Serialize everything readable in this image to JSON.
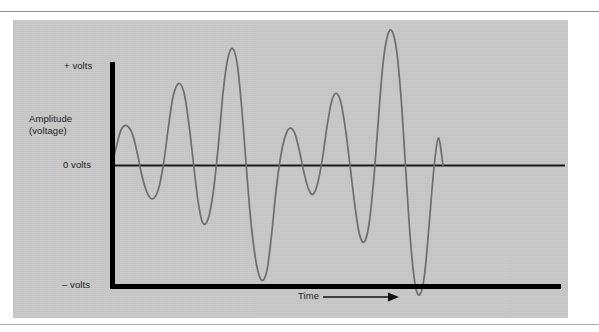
{
  "figure": {
    "panel_background": "#c9c9c9",
    "axis_color": "#000000",
    "wave_color": "#6d6d6d",
    "labels": {
      "y_max": "+ volts",
      "y_zero": "0 volts",
      "y_min": "– volts",
      "y_axis_title_line1": "Amplitude",
      "y_axis_title_line2": "(voltage)",
      "x_axis_title": "Time"
    }
  },
  "chart_data": {
    "type": "line",
    "title": "",
    "xlabel": "Time",
    "ylabel": "Amplitude (voltage)",
    "xlim": [
      0,
      100
    ],
    "ylim": [
      -100,
      100
    ],
    "grid": false,
    "legend": null,
    "ytick_labels": [
      "+ volts",
      "0 volts",
      "– volts"
    ],
    "ytick_values": [
      100,
      0,
      -100
    ],
    "xtick_labels": [],
    "annotations": [
      {
        "text": "Time",
        "type": "axis-arrow",
        "direction": "right"
      }
    ],
    "series": [
      {
        "name": "complex sound wave",
        "description": "Irregular complex waveform of varying amplitude and frequency representing a sound signal voltage over time.",
        "x": [
          0.0,
          1.2,
          2.8,
          4.5,
          6.2,
          7.8,
          9.0,
          10.5,
          12.2,
          14.0,
          15.6,
          17.0,
          18.5,
          20.2,
          21.8,
          23.2,
          24.6,
          26.0,
          27.4,
          29.0,
          30.6,
          32.2,
          33.6,
          35.0,
          36.4,
          37.8,
          39.2,
          40.6,
          42.0,
          43.6,
          45.2,
          46.8,
          48.2,
          49.6,
          51.0,
          52.4,
          53.8,
          55.2,
          56.6,
          58.0,
          59.4,
          60.8,
          62.2,
          63.6,
          65.0,
          66.4,
          67.8,
          69.2,
          70.6,
          72.0,
          73.4,
          74.8,
          76.2,
          77.6,
          79.0,
          80.4,
          81.8,
          83.2,
          84.6,
          86.0,
          87.4,
          88.8,
          90.2,
          91.6,
          93.0,
          94.4,
          95.8,
          97.2,
          98.6,
          100.0
        ],
        "y": [
          0,
          14,
          29,
          32,
          25,
          8,
          -8,
          -22,
          -28,
          -20,
          2,
          30,
          56,
          66,
          58,
          34,
          2,
          -30,
          -48,
          -45,
          -22,
          18,
          60,
          86,
          94,
          82,
          46,
          -2,
          -48,
          -82,
          -96,
          -88,
          -58,
          -20,
          8,
          24,
          30,
          26,
          12,
          -6,
          -20,
          -24,
          -14,
          6,
          32,
          52,
          58,
          50,
          28,
          -2,
          -34,
          -58,
          -64,
          -50,
          -14,
          34,
          80,
          104,
          108,
          92,
          52,
          -6,
          -64,
          -100,
          -108,
          -92,
          -50,
          -4,
          22,
          0
        ]
      }
    ]
  }
}
